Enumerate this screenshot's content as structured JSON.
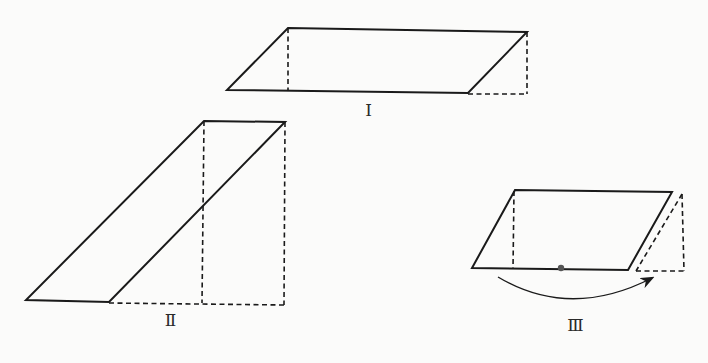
{
  "figures": [
    {
      "id": "I",
      "label": "Ⅰ",
      "label_pos": [
        368,
        112
      ],
      "parallelogram": [
        [
          288,
          28
        ],
        [
          527,
          32
        ],
        [
          468,
          93
        ],
        [
          227,
          90
        ]
      ],
      "dashed_lines": [
        [
          [
            288,
            28
          ],
          [
            288,
            91
          ]
        ],
        [
          [
            527,
            32
          ],
          [
            527,
            94
          ]
        ],
        [
          [
            468,
            94
          ],
          [
            527,
            94
          ]
        ]
      ]
    },
    {
      "id": "II",
      "label": "Ⅱ",
      "label_pos": [
        170,
        322
      ],
      "parallelogram": [
        [
          204,
          121
        ],
        [
          285,
          122
        ],
        [
          109,
          302
        ],
        [
          26,
          300
        ]
      ],
      "dashed_lines": [
        [
          [
            204,
            121
          ],
          [
            202,
            303
          ]
        ],
        [
          [
            285,
            122
          ],
          [
            284,
            305
          ]
        ],
        [
          [
            109,
            303
          ],
          [
            284,
            305
          ]
        ]
      ]
    },
    {
      "id": "III",
      "label": "Ⅲ",
      "label_pos": [
        575,
        327
      ],
      "parallelogram": [
        [
          515,
          190
        ],
        [
          672,
          192
        ],
        [
          628,
          270
        ],
        [
          472,
          268
        ]
      ],
      "dashed_lines": [
        [
          [
            514,
            191
          ],
          [
            513,
            269
          ]
        ],
        [
          [
            682,
            194
          ],
          [
            684,
            271
          ]
        ],
        [
          [
            636,
            271
          ],
          [
            684,
            271
          ]
        ],
        [
          [
            682,
            194
          ],
          [
            636,
            271
          ]
        ]
      ],
      "pivot_dot": [
        561,
        268
      ],
      "rotation_arrow": {
        "path": "M498 277 Q 570 320 652 278",
        "head_at": [
          655,
          275
        ]
      }
    }
  ],
  "colors": {
    "background": "#fbfbfa",
    "stroke": "#1a1a1a"
  }
}
